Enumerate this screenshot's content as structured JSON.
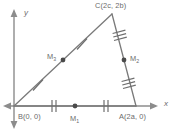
{
  "figure": {
    "kind": "coordinate-geometry-triangle-with-midpoints",
    "axes": {
      "x_label": "x",
      "y_label": "y"
    },
    "vertices": [
      {
        "key": "C",
        "label": "C(2c, 2b)",
        "name": "C",
        "coords": "(2c, 2b)",
        "px": [
          112,
          14
        ]
      },
      {
        "key": "B",
        "label": "B(0, 0)",
        "name": "B",
        "coords": "(0, 0)",
        "px": [
          14,
          106
        ]
      },
      {
        "key": "A",
        "label": "A(2a, 0)",
        "name": "A",
        "coords": "(2a, 0)",
        "px": [
          136,
          106
        ]
      }
    ],
    "midpoints": [
      {
        "key": "M1",
        "label": "M",
        "subscript": "1",
        "on_side": "BA",
        "px": [
          75,
          106
        ]
      },
      {
        "key": "M2",
        "label": "M",
        "subscript": "2",
        "on_side": "CA",
        "px": [
          124,
          60
        ]
      },
      {
        "key": "M3",
        "label": "M",
        "subscript": "3",
        "on_side": "BC",
        "px": [
          63,
          60
        ]
      }
    ],
    "sides": [
      {
        "key": "BA",
        "from": "B",
        "to": "A",
        "tick_count": 2,
        "tick_style": "perpendicular"
      },
      {
        "key": "BC",
        "from": "B",
        "to": "C",
        "tick_count": 1,
        "tick_style": "perpendicular"
      },
      {
        "key": "CA",
        "from": "C",
        "to": "A",
        "tick_count": 3,
        "tick_style": "perpendicular"
      }
    ],
    "colors": {
      "line": "#7a7a7a",
      "axis": "#8c8c8c",
      "dot": "#4a4a4a",
      "text": "#6b6b6b",
      "background": "#ffffff"
    }
  }
}
